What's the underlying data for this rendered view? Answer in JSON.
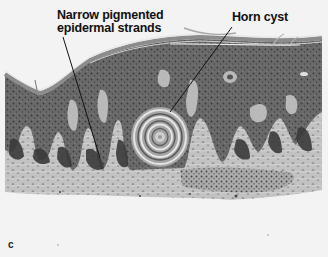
{
  "figure": {
    "panel_letter": "c",
    "labels": [
      {
        "id": "strands",
        "line1": "Narrow pigmented",
        "line2": "epidermal strands",
        "pointer": {
          "x1": 63,
          "y1": 37,
          "x2": 100,
          "y2": 158
        }
      },
      {
        "id": "cyst",
        "text": "Horn cyst",
        "pointer": {
          "x1": 232,
          "y1": 27,
          "x2": 170,
          "y2": 112
        }
      }
    ],
    "colors": {
      "background": "#f3f3f3",
      "epidermis": "#6e6e6e",
      "stratum_corneum": "#8a8a8a",
      "dermis": "#bdbdbd",
      "pigmented_strands": "#3c3c3c",
      "label_text": "#111111"
    }
  }
}
